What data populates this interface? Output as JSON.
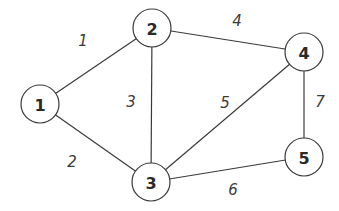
{
  "graph": {
    "nodes": [
      {
        "id": "1",
        "label": "1",
        "x": 40,
        "y": 104
      },
      {
        "id": "2",
        "label": "2",
        "x": 152,
        "y": 28
      },
      {
        "id": "3",
        "label": "3",
        "x": 151,
        "y": 182
      },
      {
        "id": "4",
        "label": "4",
        "x": 304,
        "y": 52
      },
      {
        "id": "5",
        "label": "5",
        "x": 304,
        "y": 157
      }
    ],
    "node_radius": 19,
    "edges": [
      {
        "from": "1",
        "to": "2",
        "weight": "1",
        "label_x": 83,
        "label_y": 41
      },
      {
        "from": "1",
        "to": "3",
        "weight": "2",
        "label_x": 72,
        "label_y": 162
      },
      {
        "from": "2",
        "to": "3",
        "weight": "3",
        "label_x": 131,
        "label_y": 102
      },
      {
        "from": "2",
        "to": "4",
        "weight": "4",
        "label_x": 237,
        "label_y": 21
      },
      {
        "from": "3",
        "to": "4",
        "weight": "5",
        "label_x": 225,
        "label_y": 103
      },
      {
        "from": "3",
        "to": "5",
        "weight": "6",
        "label_x": 233,
        "label_y": 190
      },
      {
        "from": "4",
        "to": "5",
        "weight": "7",
        "label_x": 320,
        "label_y": 102
      }
    ]
  }
}
